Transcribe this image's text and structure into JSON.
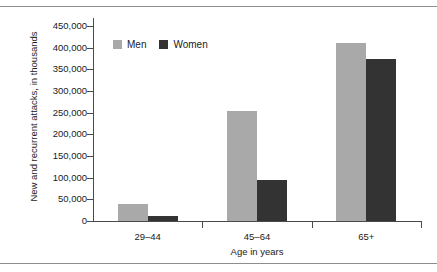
{
  "page": {
    "top_cut_text": "",
    "divider_color": "#8d8d8d"
  },
  "chart_data": {
    "type": "bar",
    "title": "",
    "xlabel": "Age in years",
    "ylabel": "New and recurrent attacks, in thousands",
    "categories": [
      "29–44",
      "45–64",
      "65+"
    ],
    "series": [
      {
        "name": "Men",
        "color": "#a9a9a9",
        "values": [
          40000,
          254000,
          410000
        ]
      },
      {
        "name": "Women",
        "color": "#333333",
        "values": [
          11000,
          94000,
          375000
        ]
      }
    ],
    "ylim": [
      0,
      450000
    ],
    "ytick_values": [
      0,
      50000,
      100000,
      150000,
      200000,
      250000,
      300000,
      350000,
      400000,
      450000
    ],
    "ytick_labels": [
      "0",
      "50,000",
      "100,000",
      "150,000",
      "200,000",
      "250,000",
      "300,000",
      "350,000",
      "400,000",
      "450,000"
    ],
    "grid": false,
    "legend_position": "top-left",
    "legend": [
      "Men",
      "Women"
    ]
  }
}
